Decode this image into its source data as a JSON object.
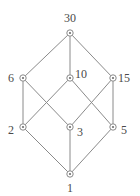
{
  "figure": {
    "kind": "hasse-diagram",
    "caption_visible": false,
    "background_color": "#ffffff",
    "edge_color": "#8a8a8a",
    "node_stroke_color": "#8a8a8a",
    "node_fill_color": "#ffffff",
    "label_color": "#4a4a4a"
  },
  "chart_data": {
    "type": "diagram",
    "title": "",
    "xlabel": "",
    "ylabel": "",
    "grid": false,
    "legend": null,
    "nodes": [
      {
        "id": "n30",
        "label": "30",
        "x": 70,
        "y": 33,
        "label_pos": "above",
        "label_x": 70,
        "label_y": 18
      },
      {
        "id": "n6",
        "label": "6",
        "x": 23,
        "y": 78,
        "label_pos": "left",
        "label_x": 11,
        "label_y": 78
      },
      {
        "id": "n10",
        "label": "10",
        "x": 70,
        "y": 78,
        "label_pos": "right",
        "label_x": 81,
        "label_y": 74
      },
      {
        "id": "n15",
        "label": "15",
        "x": 113,
        "y": 78,
        "label_pos": "right",
        "label_x": 124,
        "label_y": 78
      },
      {
        "id": "n2",
        "label": "2",
        "x": 23,
        "y": 127,
        "label_pos": "left",
        "label_x": 11,
        "label_y": 130
      },
      {
        "id": "n3",
        "label": "3",
        "x": 70,
        "y": 127,
        "label_pos": "right",
        "label_x": 80,
        "label_y": 132
      },
      {
        "id": "n5",
        "label": "5",
        "x": 113,
        "y": 127,
        "label_pos": "right",
        "label_x": 124,
        "label_y": 130
      },
      {
        "id": "n1",
        "label": "1",
        "x": 70,
        "y": 174,
        "label_pos": "below",
        "label_x": 70,
        "label_y": 188
      }
    ],
    "edges": [
      {
        "from": "n30",
        "to": "n6"
      },
      {
        "from": "n30",
        "to": "n10"
      },
      {
        "from": "n30",
        "to": "n15"
      },
      {
        "from": "n6",
        "to": "n2"
      },
      {
        "from": "n6",
        "to": "n3"
      },
      {
        "from": "n10",
        "to": "n2"
      },
      {
        "from": "n10",
        "to": "n5"
      },
      {
        "from": "n15",
        "to": "n3"
      },
      {
        "from": "n15",
        "to": "n5"
      },
      {
        "from": "n2",
        "to": "n1"
      },
      {
        "from": "n3",
        "to": "n1"
      },
      {
        "from": "n5",
        "to": "n1"
      }
    ]
  }
}
